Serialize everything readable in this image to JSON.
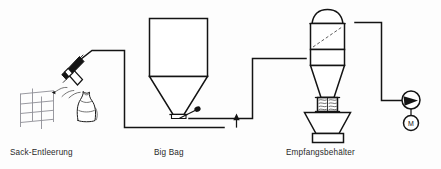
{
  "diagram": {
    "background_color": "#fdfdfd",
    "line_color": "#141414",
    "accent_color": "#8d8d95"
  },
  "stations": [
    {
      "id": "sack-emptying",
      "label": "Sack-Entleerung",
      "label_x": 10,
      "label_y": 155,
      "components": [
        "pallet-rack",
        "sack",
        "suction-lance"
      ]
    },
    {
      "id": "big-bag",
      "label": "Big Bag",
      "label_x": 154,
      "label_y": 155,
      "components": [
        "big-bag-body",
        "big-bag-cone",
        "discharge-valve"
      ]
    },
    {
      "id": "receiving-vessel",
      "label": "Empfangsbehälter",
      "label_x": 286,
      "label_y": 155,
      "components": [
        "dome-cap",
        "filter-body",
        "separator-cone",
        "rotary-valve",
        "discharge-hopper",
        "stand"
      ]
    }
  ],
  "equipment": {
    "blower": {
      "name": "blower",
      "center_x": 411,
      "center_y": 100,
      "radius": 9
    },
    "motor": {
      "name": "motor",
      "label": "M",
      "center_x": 411,
      "center_y": 123,
      "radius": 7.5
    }
  },
  "flow": {
    "arrow_label": "",
    "direction": "left-to-right",
    "arrow_x": 236,
    "arrow_y": 118
  }
}
